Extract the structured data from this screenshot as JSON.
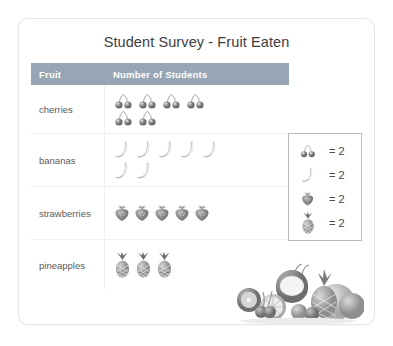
{
  "card": {
    "title": "Student Survey - Fruit Eaten"
  },
  "table": {
    "headers": {
      "fruit": "Fruit",
      "count": "Number of Students"
    },
    "rows": [
      {
        "label": "cherries",
        "icon": "cherry-icon",
        "symbols": 6,
        "per_symbol": 2,
        "total": 12
      },
      {
        "label": "bananas",
        "icon": "banana-icon",
        "symbols": 7,
        "per_symbol": 2,
        "total": 14
      },
      {
        "label": "strawberries",
        "icon": "strawberry-icon",
        "symbols": 5,
        "per_symbol": 2,
        "total": 10
      },
      {
        "label": "pineapples",
        "icon": "pineapple-icon",
        "symbols": 3,
        "per_symbol": 2,
        "total": 6
      }
    ]
  },
  "legend": {
    "entries": [
      {
        "icon": "cherry-icon",
        "value": "= 2"
      },
      {
        "icon": "banana-icon",
        "value": "= 2"
      },
      {
        "icon": "strawberry-icon",
        "value": "= 2"
      },
      {
        "icon": "pineapple-icon",
        "value": "= 2"
      }
    ]
  },
  "photo": {
    "alt": "assorted fruit photo"
  },
  "colors": {
    "header_bar": "#97a6b5",
    "header_text": "#ffffff",
    "title_text": "#3d3d3d",
    "body_text": "#5a5a5a",
    "card_border": "#e6e6e6",
    "legend_border": "#b8b8b8"
  },
  "chart_data": {
    "type": "pictograph",
    "title": "Student Survey - Fruit Eaten",
    "xlabel": "Number of Students",
    "ylabel": "Fruit",
    "key": "each fruit symbol = 2 students",
    "symbol_value": 2,
    "categories": [
      "cherries",
      "bananas",
      "strawberries",
      "pineapples"
    ],
    "symbol_counts": [
      6,
      7,
      5,
      3
    ],
    "values": [
      12,
      14,
      10,
      6
    ],
    "legend": [
      "cherries = 2",
      "bananas = 2",
      "strawberries = 2",
      "pineapples = 2"
    ],
    "grid": false,
    "legend_position": "right"
  }
}
